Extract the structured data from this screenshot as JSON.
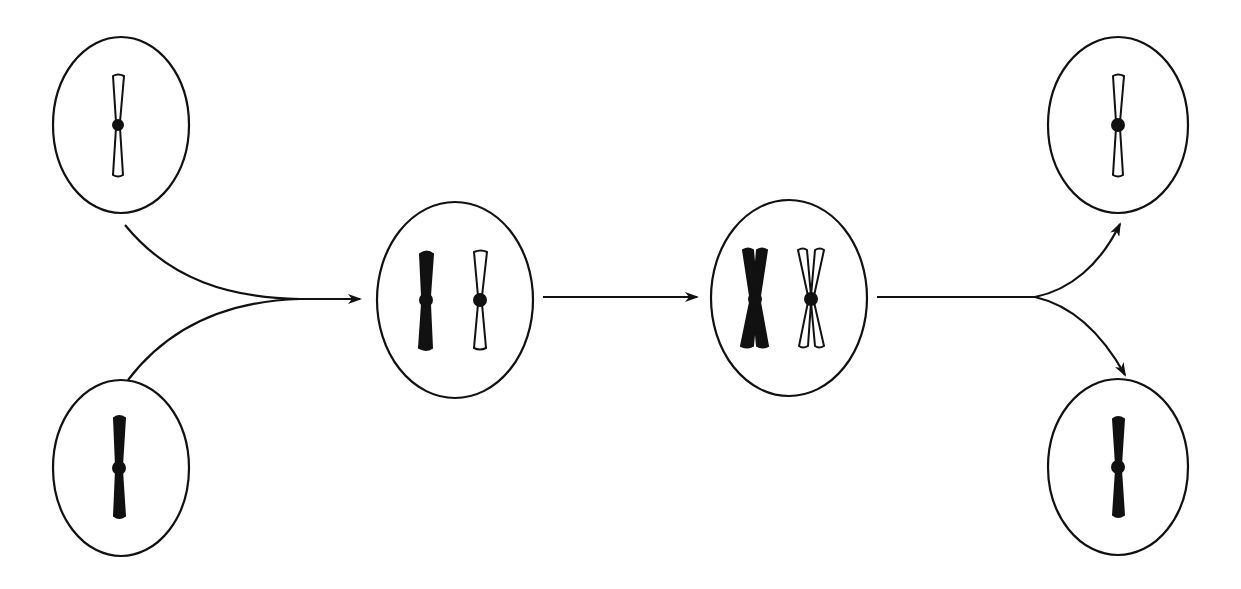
{
  "diagram": {
    "title": "",
    "stroke_color": "#111111",
    "background": "#ffffff",
    "cells": [
      {
        "id": "parent-light",
        "cx": 121,
        "cy": 125,
        "rx": 68,
        "ry": 88,
        "chromosomes": [
          {
            "x": 118,
            "style": "light",
            "type": "single"
          }
        ]
      },
      {
        "id": "parent-dark",
        "cx": 121,
        "cy": 468,
        "rx": 68,
        "ry": 88,
        "chromosomes": [
          {
            "x": 119,
            "style": "dark",
            "type": "single"
          }
        ]
      },
      {
        "id": "zygote",
        "cx": 455,
        "cy": 300,
        "rx": 78,
        "ry": 98,
        "chromosomes": [
          {
            "x": 426,
            "style": "dark",
            "type": "single"
          },
          {
            "x": 480,
            "style": "light",
            "type": "single"
          }
        ]
      },
      {
        "id": "replicated",
        "cx": 789,
        "cy": 298,
        "rx": 78,
        "ry": 98,
        "chromosomes": [
          {
            "x": 755,
            "style": "dark",
            "type": "double"
          },
          {
            "x": 811,
            "style": "light",
            "type": "double"
          }
        ]
      },
      {
        "id": "gamete-light",
        "cx": 1118,
        "cy": 125,
        "rx": 70,
        "ry": 88,
        "chromosomes": [
          {
            "x": 1118,
            "style": "light",
            "type": "single"
          }
        ]
      },
      {
        "id": "gamete-dark",
        "cx": 1118,
        "cy": 467,
        "rx": 70,
        "ry": 88,
        "chromosomes": [
          {
            "x": 1118,
            "style": "dark",
            "type": "single"
          }
        ]
      }
    ],
    "arrows": [
      {
        "id": "arrow-merge",
        "from": "parents",
        "to": "zygote"
      },
      {
        "id": "arrow-replicate",
        "from": "zygote",
        "to": "replicated"
      },
      {
        "id": "arrow-split",
        "from": "replicated",
        "to": "gametes"
      }
    ]
  }
}
